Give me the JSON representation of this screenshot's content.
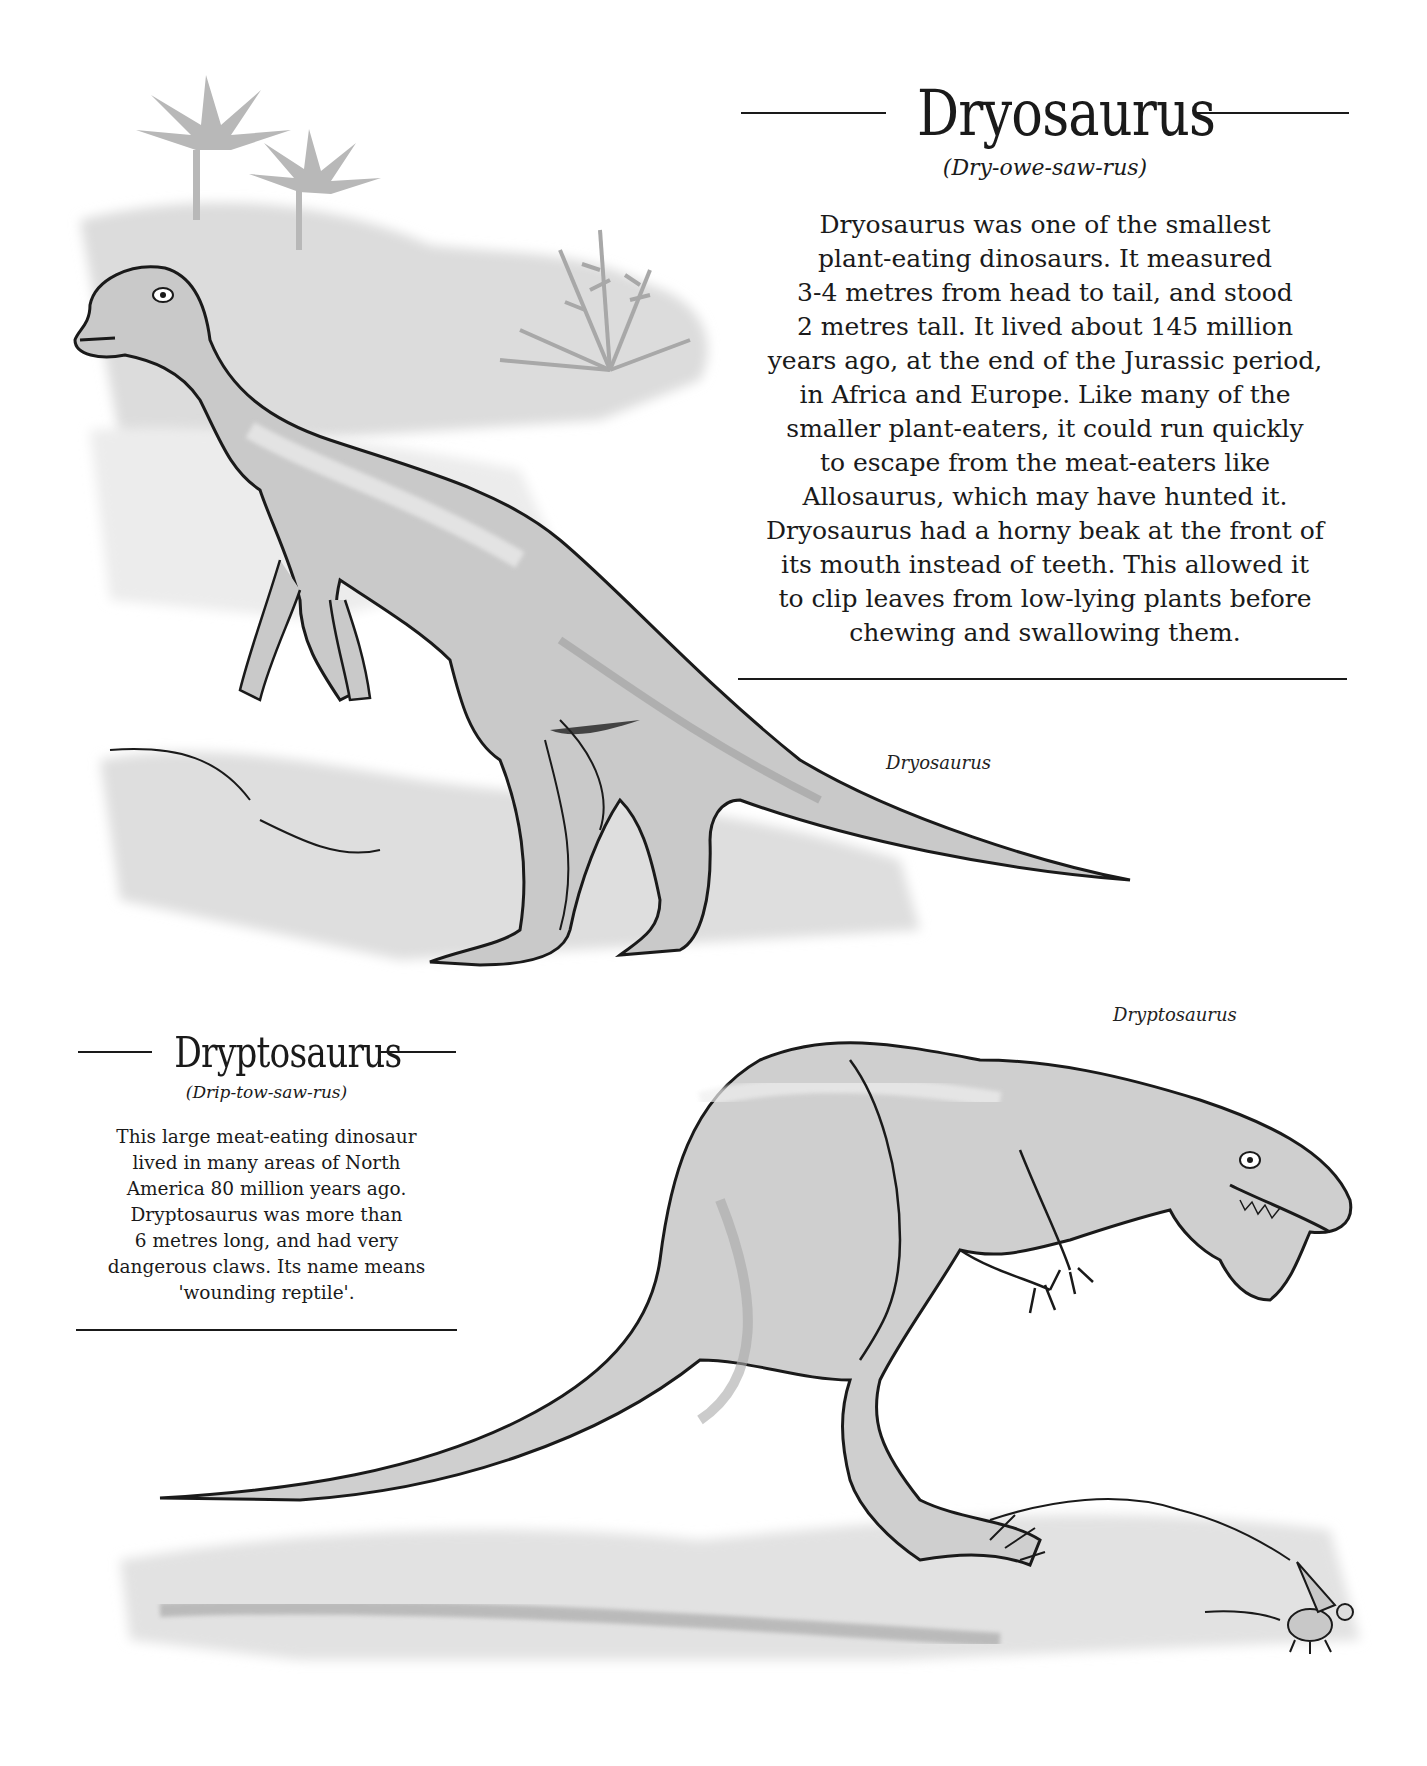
{
  "sections": [
    {
      "name": "Dryosaurus",
      "pronunciation": "(Dry-owe-saw-rus)",
      "body_lines": [
        "Dryosaurus was one of the smallest",
        "plant-eating dinosaurs. It measured",
        "3-4 metres from head to tail, and stood",
        "2 metres tall. It lived about 145 million",
        "years ago, at the end of the Jurassic period,",
        "in Africa and Europe. Like many of the",
        "smaller plant-eaters, it could run quickly",
        "to escape from the meat-eaters like",
        "Allosaurus, which may have hunted it.",
        "Dryosaurus had a horny beak at the front of",
        "its mouth instead of teeth. This allowed it",
        "to clip leaves from low-lying plants before",
        "chewing and swallowing them."
      ],
      "caption": "Dryosaurus"
    },
    {
      "name": "Dryptosaurus",
      "pronunciation": "(Drip-tow-saw-rus)",
      "body_lines": [
        "This large meat-eating dinosaur",
        "lived in many areas of North",
        "America 80 million years ago.",
        "Dryptosaurus was more than",
        "6 metres long, and had very",
        "dangerous claws. Its name means",
        "'wounding reptile'."
      ],
      "caption": "Dryptosaurus"
    }
  ],
  "illustrations": [
    {
      "subject": "dryosaurus-illustration",
      "scene": "plant-eating dinosaur standing on ground with palm trees and fern behind"
    },
    {
      "subject": "dryptosaurus-illustration",
      "scene": "meat-eating dinosaur crouching, clawed hands raised, small mouse-like mammal at right"
    }
  ],
  "colors": {
    "ink": "#1a1a1a",
    "wash_light": "#e4e4e4",
    "wash_mid": "#c4c4c4",
    "wash_dark": "#9a9a9a",
    "background": "#ffffff"
  }
}
